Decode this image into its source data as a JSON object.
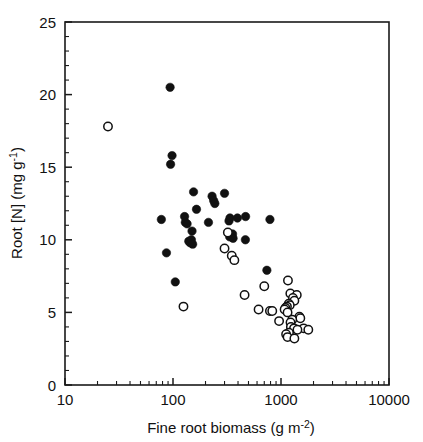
{
  "figure": {
    "name": "root-nitrogen-vs-fine-root-biomass-scatter",
    "background": "#ffffff",
    "foreground": "#111111"
  },
  "chart_data": {
    "type": "scatter",
    "title": "",
    "xlabel_main": "Fine root biomass (g m",
    "xlabel_sup": "-2",
    "xlabel_tail": ")",
    "xlabel_plain": "Fine root biomass (g m-2)",
    "ylabel_main": "Root [N] (mg g",
    "ylabel_sup": "-1",
    "ylabel_tail": ")",
    "ylabel_plain": "Root [N] (mg g-1)",
    "xscale": "log",
    "yscale": "linear",
    "xlim": [
      10,
      10000
    ],
    "ylim": [
      0,
      25
    ],
    "xticks": [
      10,
      100,
      1000,
      10000
    ],
    "xticklabels": [
      "10",
      "100",
      "1000",
      "10000"
    ],
    "yticks": [
      0,
      5,
      10,
      15,
      20,
      25
    ],
    "yticklabels": [
      "0",
      "5",
      "10",
      "15",
      "20",
      "25"
    ],
    "y_minor_step": 1,
    "grid": false,
    "legend": null,
    "marker_radius_px": 4.2,
    "series": [
      {
        "name": "filled-circles",
        "marker": "filled-circle",
        "color": "#111111",
        "points": [
          [
            94,
            20.5
          ],
          [
            98,
            15.8
          ],
          [
            95,
            15.2
          ],
          [
            155,
            13.3
          ],
          [
            230,
            13.0
          ],
          [
            300,
            13.2
          ],
          [
            238,
            12.7
          ],
          [
            244,
            12.5
          ],
          [
            165,
            12.1
          ],
          [
            78,
            11.4
          ],
          [
            128,
            11.6
          ],
          [
            130,
            11.2
          ],
          [
            135,
            11.1
          ],
          [
            213,
            11.2
          ],
          [
            330,
            11.3
          ],
          [
            337,
            11.5
          ],
          [
            395,
            11.5
          ],
          [
            470,
            11.6
          ],
          [
            790,
            11.4
          ],
          [
            150,
            10.6
          ],
          [
            335,
            10.2
          ],
          [
            345,
            10.3
          ],
          [
            352,
            10.2
          ],
          [
            356,
            10.4
          ],
          [
            360,
            10.1
          ],
          [
            468,
            10.0
          ],
          [
            140,
            9.9
          ],
          [
            144,
            9.8
          ],
          [
            148,
            10.0
          ],
          [
            152,
            9.7
          ],
          [
            87,
            9.1
          ],
          [
            740,
            7.9
          ],
          [
            105,
            7.1
          ]
        ]
      },
      {
        "name": "open-circles",
        "marker": "open-circle",
        "color": "#111111",
        "points": [
          [
            25,
            17.8
          ],
          [
            322,
            10.5
          ],
          [
            300,
            9.4
          ],
          [
            350,
            8.9
          ],
          [
            370,
            8.6
          ],
          [
            1160,
            7.2
          ],
          [
            700,
            6.8
          ],
          [
            460,
            6.2
          ],
          [
            125,
            5.4
          ],
          [
            1220,
            6.3
          ],
          [
            1400,
            6.2
          ],
          [
            1290,
            6.0
          ],
          [
            1330,
            5.8
          ],
          [
            1180,
            5.6
          ],
          [
            1205,
            5.5
          ],
          [
            1135,
            5.4
          ],
          [
            1100,
            5.3
          ],
          [
            1080,
            5.2
          ],
          [
            620,
            5.2
          ],
          [
            790,
            5.1
          ],
          [
            830,
            5.1
          ],
          [
            1150,
            5.0
          ],
          [
            1480,
            4.7
          ],
          [
            1510,
            4.6
          ],
          [
            1270,
            4.5
          ],
          [
            960,
            4.4
          ],
          [
            1225,
            4.3
          ],
          [
            1235,
            4.0
          ],
          [
            1320,
            3.9
          ],
          [
            1620,
            3.9
          ],
          [
            1790,
            3.8
          ],
          [
            1420,
            3.8
          ],
          [
            1185,
            3.6
          ],
          [
            1115,
            3.5
          ],
          [
            1150,
            3.3
          ],
          [
            1330,
            3.2
          ]
        ]
      }
    ]
  }
}
